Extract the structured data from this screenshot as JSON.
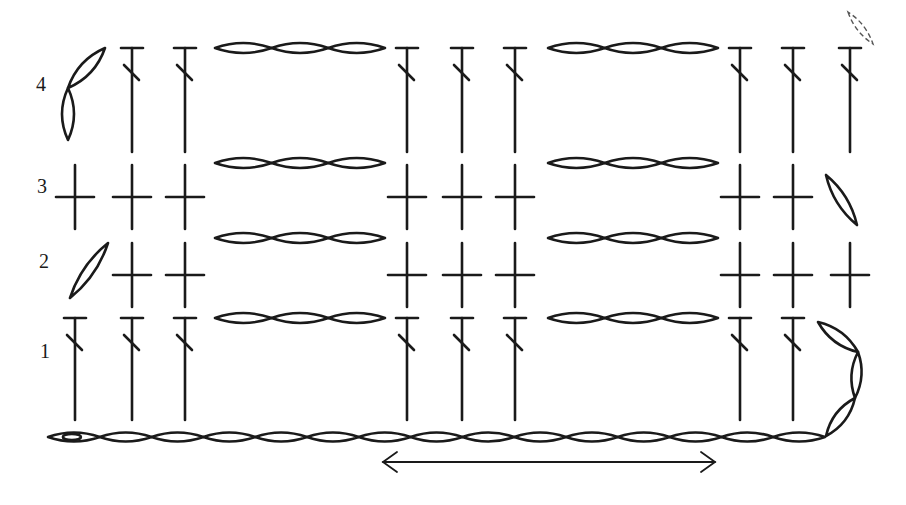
{
  "diagram": {
    "type": "crochet-stitch-chart",
    "colors": {
      "ink": "#1a1a1a",
      "background": "#ffffff",
      "faded": "#555555"
    },
    "row_labels": [
      {
        "text": "4",
        "x": 36,
        "y": 74
      },
      {
        "text": "3",
        "x": 37,
        "y": 176
      },
      {
        "text": "2",
        "x": 39,
        "y": 251
      },
      {
        "text": "1",
        "x": 40,
        "y": 341
      }
    ],
    "columns_x": [
      75,
      132,
      185,
      407,
      462,
      515,
      740,
      793,
      850
    ],
    "chain_groups_x": [
      [
        215,
        385
      ],
      [
        548,
        718
      ]
    ],
    "rows": [
      {
        "row": 1,
        "stitch": "double-crochet",
        "y_top": 318,
        "y_bottom": 420,
        "columns": [
          75,
          132,
          185,
          407,
          462,
          515,
          740,
          793
        ],
        "chain_y": 318,
        "turning_chain": "right-3"
      },
      {
        "row": 2,
        "stitch": "single-crochet",
        "y_center": 275,
        "columns": [
          132,
          185,
          407,
          462,
          515,
          740,
          793,
          850
        ],
        "chain_y": 238,
        "turning_chain": "left-1"
      },
      {
        "row": 3,
        "stitch": "single-crochet",
        "y_center": 197,
        "columns": [
          75,
          132,
          185,
          407,
          462,
          515,
          740,
          793
        ],
        "chain_y": 163,
        "turning_chain": "right-1"
      },
      {
        "row": 4,
        "stitch": "double-crochet",
        "y_top": 48,
        "y_bottom": 152,
        "columns": [
          132,
          185,
          407,
          462,
          515,
          740,
          793,
          850
        ],
        "chain_y": 48,
        "turning_chain": "left-2"
      }
    ],
    "foundation_chain": {
      "y": 437,
      "x_start": 48,
      "x_end": 825,
      "count": 15,
      "slip_knot": true
    },
    "repeat_arrow": {
      "x1": 383,
      "x2": 715,
      "y": 462
    },
    "legend": {
      "double_crochet": "T-bar stem with diagonal slash",
      "single_crochet": "plus sign",
      "chain": "oval"
    }
  }
}
